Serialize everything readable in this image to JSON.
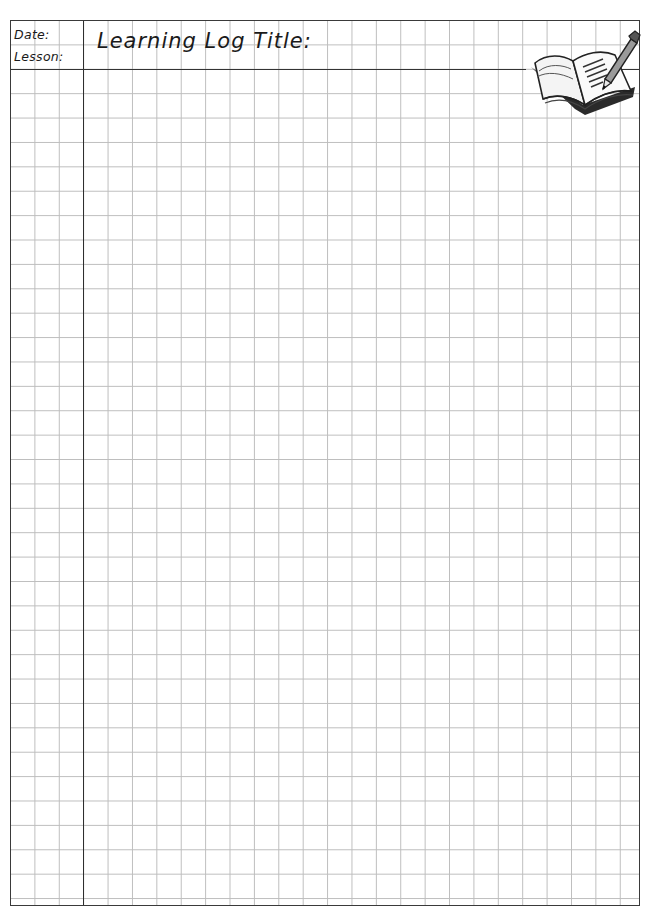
{
  "header": {
    "date_label": "Date:",
    "lesson_label": "Lesson:",
    "title": "Learning Log Title:"
  },
  "decorations": {
    "corner_icon": "open-book-with-pencil-icon"
  },
  "grid": {
    "cell_size_px": 24.4,
    "line_color": "#bdbdbd",
    "border_color": "#3a3a3a",
    "margin_columns": 3,
    "header_rows": 2
  }
}
